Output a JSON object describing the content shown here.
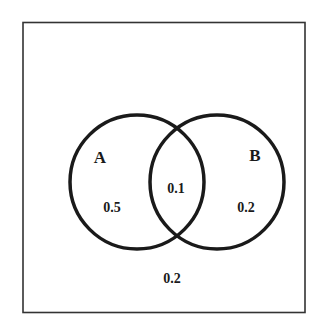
{
  "diagram": {
    "type": "venn",
    "sets": [
      {
        "name": "A",
        "only_value": "0.5"
      },
      {
        "name": "B",
        "only_value": "0.2"
      }
    ],
    "intersection_value": "0.1",
    "outside_value": "0.2",
    "colors": {
      "stroke": "#1a1a1a",
      "background": "#ffffff"
    }
  }
}
